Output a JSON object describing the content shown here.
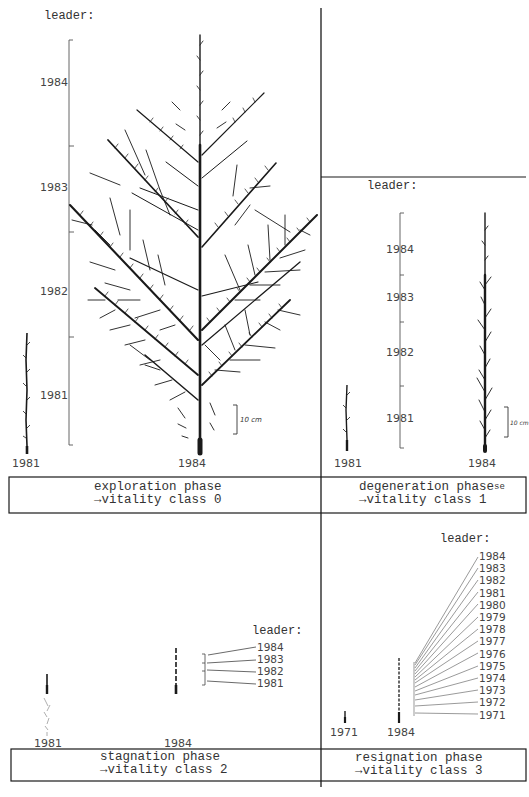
{
  "figure": {
    "panels": [
      {
        "id": "exploration",
        "leader_label": "leader:",
        "leader_years": [
          "1984",
          "1983",
          "1982",
          "1981"
        ],
        "tree_labels": [
          "1981",
          "1984"
        ],
        "scale_label": "10 cm",
        "caption_line1": "exploration phase",
        "caption_line2": "→vitality class 0"
      },
      {
        "id": "degeneration",
        "leader_label": "leader:",
        "leader_years": [
          "1984",
          "1983",
          "1982",
          "1981"
        ],
        "tree_labels": [
          "1981",
          "1984"
        ],
        "scale_label": "10 cm",
        "caption_line1": "degeneration phase",
        "caption_suffix": "se",
        "caption_line2": "→vitality class 1"
      },
      {
        "id": "stagnation",
        "leader_label": "leader:",
        "leader_years": [
          "1984",
          "1983",
          "1982",
          "1981"
        ],
        "tree_labels": [
          "1981",
          "1984"
        ],
        "caption_line1": "stagnation phase",
        "caption_line2": "→vitality class 2"
      },
      {
        "id": "resignation",
        "leader_label": "leader:",
        "leader_years": [
          "1984",
          "1983",
          "1982",
          "1981",
          "1980",
          "1979",
          "1978",
          "1977",
          "1976",
          "1975",
          "1974",
          "1973",
          "1972",
          "1971"
        ],
        "tree_labels": [
          "1971",
          "1984"
        ],
        "caption_line1": "resignation phase",
        "caption_line2": "→vitality class 3"
      }
    ],
    "colors": {
      "ink": "#1a1a1a",
      "paper": "#ffffff",
      "faint": "#9a9a9a"
    }
  }
}
